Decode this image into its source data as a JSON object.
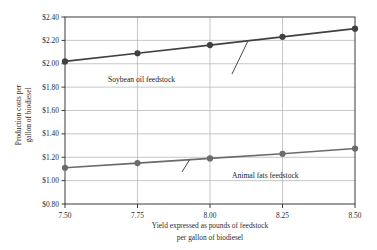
{
  "chart_data": {
    "type": "line",
    "title": "",
    "xlabel": "Yield expressed as pounds of feedstock per gallon of biodiesel",
    "xlabel_line1": "Yield expressed as pounds of feedstock",
    "xlabel_line2": "per gallon of biodiesel",
    "ylabel": "Production costs per gallon of biodiesel",
    "ylabel_line1": "Production costs per",
    "ylabel_line2": "gallon of biodiesel",
    "x": [
      7.5,
      7.75,
      8.0,
      8.25,
      8.5
    ],
    "xtick_labels": [
      "7.50",
      "7.75",
      "8.00",
      "8.25",
      "8.50"
    ],
    "ytick_labels": [
      "$2.40",
      "$2.20",
      "$2.00",
      "$1.80",
      "$1.60",
      "$1.40",
      "$1.20",
      "$1.00",
      "$0.80"
    ],
    "ytick_values": [
      2.4,
      2.2,
      2.0,
      1.8,
      1.6,
      1.4,
      1.2,
      1.0,
      0.8
    ],
    "xlim": [
      7.5,
      8.5
    ],
    "ylim": [
      0.8,
      2.4
    ],
    "grid": true,
    "legend_position": "inline-annotations",
    "series": [
      {
        "name": "Soybean oil feedstock",
        "color": "#404040",
        "marker": "circle",
        "values": [
          2.02,
          2.09,
          2.16,
          2.23,
          2.3
        ]
      },
      {
        "name": "Animal fats feedstock",
        "color": "#6b6b6b",
        "marker": "circle",
        "values": [
          1.11,
          1.15,
          1.19,
          1.23,
          1.275
        ]
      }
    ],
    "annotations": [
      {
        "text": "Soybean oil feedstock",
        "points_to_series": "Soybean oil feedstock",
        "points_to_x": 8.13,
        "points_to_y": 2.19
      },
      {
        "text": "Animal fats feedstock",
        "points_to_series": "Animal fats feedstock",
        "points_to_x": 7.93,
        "points_to_y": 1.18
      }
    ],
    "colors": {
      "grid": "#b9b9b9",
      "axis": "#3a3a3a",
      "background": "#ffffff",
      "text": "#1a1a1a"
    }
  }
}
